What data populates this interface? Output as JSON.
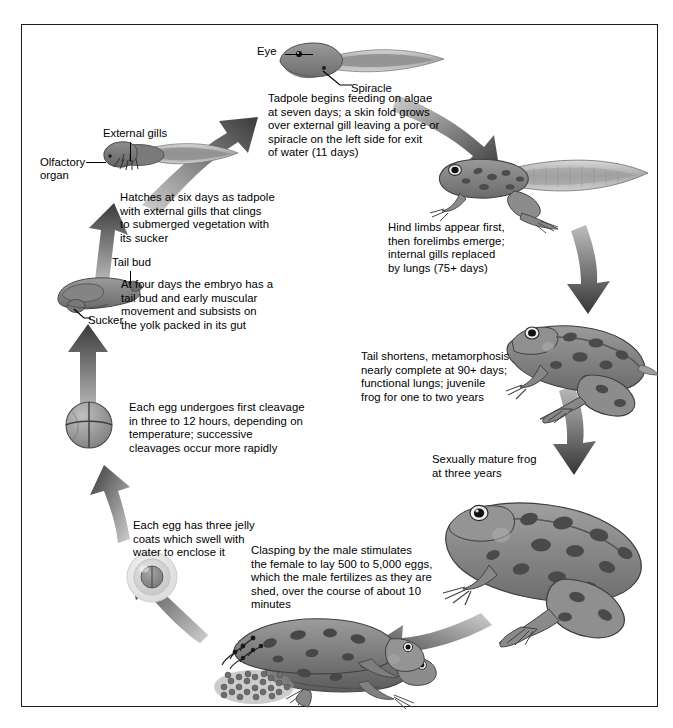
{
  "diagram": {
    "border_color": "#1a1a1a",
    "background": "#ffffff"
  },
  "stages": [
    {
      "id": "tadpole-feeding",
      "labels": [
        "Eye",
        "Spiracle"
      ],
      "text": "Tadpole begins feeding on algae\nat seven days; a skin fold grows\nover external gill leaving a pore or\nspiracle on the left side for exit\nof water (11 days)"
    },
    {
      "id": "hatchling",
      "labels": [
        "External gills",
        "Olfactory\norgan"
      ],
      "text": "Hatches at six days as tadpole\nwith external gills that clings\nto submerged vegetation with\nits sucker"
    },
    {
      "id": "embryo-tailbud",
      "labels": [
        "Tail bud",
        "Sucker"
      ],
      "text": "At four days the embryo has a\ntail bud and early muscular\nmovement and subsists on\nthe yolk packed in its gut"
    },
    {
      "id": "cleavage",
      "labels": [],
      "text": "Each egg undergoes first cleavage\nin three to 12 hours, depending on\ntemperature; successive\ncleavages occur more rapidly"
    },
    {
      "id": "jelly-egg",
      "labels": [],
      "text": "Each egg has three jelly\ncoats which swell with\nwater to enclose it"
    },
    {
      "id": "amplexus",
      "labels": [],
      "text": "Clasping by the male stimulates\nthe female to lay 500 to 5,000 eggs,\nwhich the male fertilizes as they are\nshed, over the course of about 10\nminutes"
    },
    {
      "id": "adult-frog",
      "labels": [],
      "text": "Sexually mature frog\nat three years"
    },
    {
      "id": "juvenile-frog",
      "labels": [],
      "text": "Tail shortens, metamorphosis\nnearly complete at 90+ days;\nfunctional lungs; juvenile\nfrog for one to two years"
    },
    {
      "id": "limbed-tadpole",
      "labels": [],
      "text": "Hind limbs appear first,\nthen forelimbs emerge;\ninternal gills replaced\nby lungs (75+ days)"
    }
  ],
  "colors": {
    "body_mid": "#8b8b8b",
    "body_dark": "#5e5e5e",
    "body_light": "#b4b4b4",
    "tail_fin": "#c9c9c9",
    "spot_dark": "#4a4a4a",
    "arrow_dark": "#3b3b3b",
    "arrow_light": "#c8c8c8",
    "outline": "#2b2b2b"
  }
}
